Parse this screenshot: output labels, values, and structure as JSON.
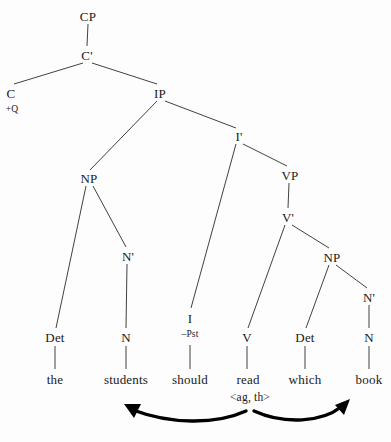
{
  "diagram": {
    "sentence": "the students should read which book",
    "ink_color": "#2b2b2b",
    "background_color": "#fdfdfd",
    "arrow_color": "#000000"
  },
  "nodes": [
    {
      "id": "cp",
      "label": "CP",
      "x": 88,
      "y": 16,
      "size": "normal"
    },
    {
      "id": "cbar",
      "label": "C'",
      "x": 87,
      "y": 55,
      "size": "normal"
    },
    {
      "id": "c",
      "label": "C",
      "x": 11,
      "y": 93,
      "size": "normal"
    },
    {
      "id": "c-feature",
      "label": "+Q",
      "x": 12,
      "y": 110,
      "size": "small"
    },
    {
      "id": "ip",
      "label": "IP",
      "x": 160,
      "y": 93,
      "size": "normal"
    },
    {
      "id": "ibar",
      "label": "I'",
      "x": 239,
      "y": 136,
      "size": "normal"
    },
    {
      "id": "np-subj",
      "label": "NP",
      "x": 89,
      "y": 178,
      "size": "normal"
    },
    {
      "id": "vp",
      "label": "VP",
      "x": 290,
      "y": 175,
      "size": "normal"
    },
    {
      "id": "nbar-subj",
      "label": "N'",
      "x": 128,
      "y": 256,
      "size": "normal"
    },
    {
      "id": "vbar",
      "label": "V'",
      "x": 288,
      "y": 217,
      "size": "normal"
    },
    {
      "id": "np-obj",
      "label": "NP",
      "x": 332,
      "y": 257,
      "size": "normal"
    },
    {
      "id": "nbar-obj",
      "label": "N'",
      "x": 369,
      "y": 297,
      "size": "normal"
    },
    {
      "id": "det-subj",
      "label": "Det",
      "x": 55,
      "y": 337,
      "size": "normal"
    },
    {
      "id": "n-subj",
      "label": "N",
      "x": 126,
      "y": 337,
      "size": "normal"
    },
    {
      "id": "i",
      "label": "I",
      "x": 190,
      "y": 318,
      "size": "normal"
    },
    {
      "id": "i-feature",
      "label": "–Pst",
      "x": 190,
      "y": 335,
      "size": "small"
    },
    {
      "id": "v",
      "label": "V",
      "x": 247,
      "y": 337,
      "size": "normal"
    },
    {
      "id": "det-obj",
      "label": "Det",
      "x": 305,
      "y": 337,
      "size": "normal"
    },
    {
      "id": "n-obj",
      "label": "N",
      "x": 369,
      "y": 337,
      "size": "normal"
    },
    {
      "id": "word-the",
      "label": "the",
      "x": 55,
      "y": 379,
      "size": "word"
    },
    {
      "id": "word-students",
      "label": "students",
      "x": 126,
      "y": 379,
      "size": "word"
    },
    {
      "id": "word-should",
      "label": "should",
      "x": 190,
      "y": 379,
      "size": "word"
    },
    {
      "id": "word-read",
      "label": "read",
      "x": 248,
      "y": 379,
      "size": "word"
    },
    {
      "id": "word-which",
      "label": "which",
      "x": 305,
      "y": 379,
      "size": "word"
    },
    {
      "id": "word-book",
      "label": "book",
      "x": 369,
      "y": 379,
      "size": "word"
    },
    {
      "id": "theta-roles",
      "label": "<ag, th>",
      "x": 250,
      "y": 398,
      "size": "roles"
    }
  ],
  "edges": [
    {
      "id": "cp-cbar",
      "x1": 88,
      "y1": 24,
      "x2": 87,
      "y2": 46
    },
    {
      "id": "cbar-c",
      "x1": 83,
      "y1": 63,
      "x2": 14,
      "y2": 84
    },
    {
      "id": "cbar-ip",
      "x1": 92,
      "y1": 63,
      "x2": 157,
      "y2": 84
    },
    {
      "id": "ip-np",
      "x1": 157,
      "y1": 101,
      "x2": 90,
      "y2": 170
    },
    {
      "id": "ip-ibar",
      "x1": 165,
      "y1": 101,
      "x2": 236,
      "y2": 128
    },
    {
      "id": "ibar-i",
      "x1": 236,
      "y1": 144,
      "x2": 191,
      "y2": 308
    },
    {
      "id": "ibar-vp",
      "x1": 243,
      "y1": 144,
      "x2": 287,
      "y2": 166
    },
    {
      "id": "vp-vbar",
      "x1": 289,
      "y1": 183,
      "x2": 288,
      "y2": 208
    },
    {
      "id": "vbar-v",
      "x1": 285,
      "y1": 225,
      "x2": 248,
      "y2": 328
    },
    {
      "id": "vbar-npobj",
      "x1": 292,
      "y1": 225,
      "x2": 329,
      "y2": 248
    },
    {
      "id": "np-det-subj",
      "x1": 86,
      "y1": 186,
      "x2": 56,
      "y2": 328
    },
    {
      "id": "np-nbar-subj",
      "x1": 93,
      "y1": 186,
      "x2": 126,
      "y2": 247
    },
    {
      "id": "nbar-n-subj",
      "x1": 127,
      "y1": 264,
      "x2": 126,
      "y2": 328
    },
    {
      "id": "npobj-det",
      "x1": 329,
      "y1": 265,
      "x2": 306,
      "y2": 328
    },
    {
      "id": "npobj-nbar",
      "x1": 336,
      "y1": 265,
      "x2": 367,
      "y2": 288
    },
    {
      "id": "nbar-n-obj",
      "x1": 369,
      "y1": 305,
      "x2": 369,
      "y2": 328
    },
    {
      "id": "det-the",
      "x1": 55,
      "y1": 346,
      "x2": 55,
      "y2": 369
    },
    {
      "id": "n-students",
      "x1": 126,
      "y1": 346,
      "x2": 126,
      "y2": 369
    },
    {
      "id": "i-should",
      "x1": 190,
      "y1": 345,
      "x2": 190,
      "y2": 369
    },
    {
      "id": "v-read",
      "x1": 247,
      "y1": 346,
      "x2": 247,
      "y2": 369
    },
    {
      "id": "det-which",
      "x1": 305,
      "y1": 346,
      "x2": 305,
      "y2": 369
    },
    {
      "id": "n-book",
      "x1": 369,
      "y1": 346,
      "x2": 369,
      "y2": 369
    }
  ],
  "theta_arrows": [
    {
      "id": "agent-arrow",
      "from_word": "read",
      "to_word": "students",
      "role": "ag",
      "direction": "left"
    },
    {
      "id": "theme-arrow",
      "from_word": "read",
      "to_word": "book",
      "role": "th",
      "direction": "right"
    }
  ]
}
